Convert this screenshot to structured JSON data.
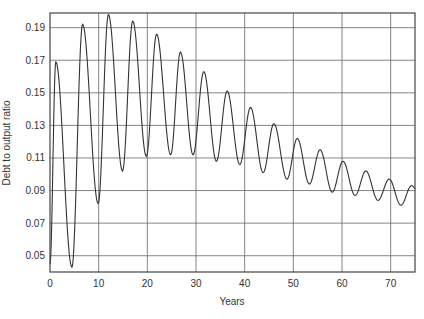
{
  "chart_data": {
    "type": "line",
    "title": "",
    "xlabel": "Years",
    "ylabel": "Debt to output ratio",
    "xlim": [
      0,
      75
    ],
    "ylim": [
      0.04,
      0.199
    ],
    "grid": true,
    "legend": null,
    "x_ticks": [
      0,
      10,
      20,
      30,
      40,
      50,
      60,
      70
    ],
    "x_tick_labels": [
      "0",
      "10",
      "20",
      "30",
      "40",
      "50",
      "60",
      "70"
    ],
    "y_ticks": [
      0.05,
      0.07,
      0.09,
      0.11,
      0.13,
      0.15,
      0.17,
      0.19
    ],
    "y_tick_labels": [
      "0.05",
      "0.07",
      "0.09",
      "0.11",
      "0.13",
      "0.15",
      "0.17",
      "0.19"
    ],
    "series": [
      {
        "name": "Debt to output ratio",
        "color": "#333333",
        "description": "Damped oscillation, period ~5 years, converging downward toward ~0.087",
        "x": [
          0,
          1.2,
          4.5,
          6.7,
          9.9,
          12.0,
          14.9,
          17.0,
          19.8,
          21.9,
          24.8,
          26.8,
          29.4,
          31.6,
          34.2,
          36.4,
          39.0,
          41.2,
          43.8,
          46.0,
          48.7,
          50.8,
          53.3,
          55.5,
          58.0,
          60.2,
          62.7,
          64.9,
          67.4,
          69.7,
          72.1,
          74.3,
          75.2
        ],
        "y": [
          0.045,
          0.169,
          0.043,
          0.192,
          0.082,
          0.198,
          0.102,
          0.194,
          0.111,
          0.186,
          0.112,
          0.175,
          0.112,
          0.163,
          0.108,
          0.151,
          0.106,
          0.141,
          0.101,
          0.131,
          0.097,
          0.122,
          0.094,
          0.115,
          0.089,
          0.108,
          0.087,
          0.102,
          0.084,
          0.097,
          0.081,
          0.093,
          0.091
        ]
      }
    ]
  },
  "layout": {
    "plot_left": 50,
    "plot_top": 13,
    "plot_right": 415,
    "plot_bottom": 272
  }
}
